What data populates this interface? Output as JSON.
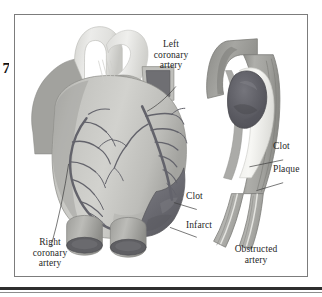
{
  "page": {
    "margin_mark": "7"
  },
  "figure": {
    "panels": [
      {
        "name": "heart-panel",
        "caption": ""
      },
      {
        "name": "artery-panel",
        "caption": "Obstructed\nartery"
      }
    ],
    "labels": {
      "left_coronary_artery": "Left\ncoronary\nartery",
      "right_coronary_artery": "Right\ncoronary\nartery",
      "clot_heart": "Clot",
      "infarct": "Infarct",
      "clot_artery": "Clot",
      "plaque": "Plaque",
      "obstructed_artery": "Obstructed\nartery"
    },
    "icons": {
      "heart": "heart-illustration",
      "artery": "obstructed-artery-illustration"
    },
    "colors": {
      "frame_border": "#7c7c7c",
      "page_background": "#ffffff",
      "heart_muscle_light": "#d8d8d4",
      "heart_muscle_mid": "#bcbcb8",
      "heart_muscle_dark": "#9a9a96",
      "great_vessel_light": "#e8e8e6",
      "coronary_vessel": "#6a6a72",
      "infarct": "#6e6e74",
      "clot": "#5d5d64",
      "plaque": "#efefec",
      "artery_wall": "#a8a8a4",
      "vessel_lumen_dark": "#5a5a5e",
      "leader_line": "#4a4a4a",
      "rule": "#2e2e2e",
      "text": "#1f1f1f"
    }
  }
}
